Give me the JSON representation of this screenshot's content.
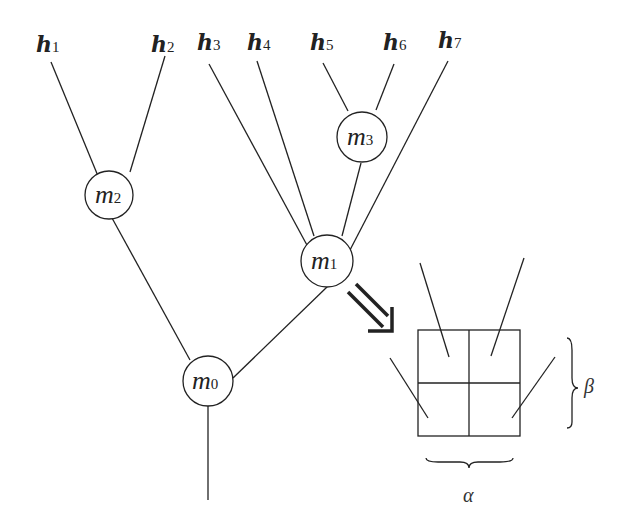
{
  "diagram": {
    "leaves": [
      {
        "base": "h",
        "sub": "1"
      },
      {
        "base": "h",
        "sub": "2"
      },
      {
        "base": "h",
        "sub": "3"
      },
      {
        "base": "h",
        "sub": "4"
      },
      {
        "base": "h",
        "sub": "5"
      },
      {
        "base": "h",
        "sub": "6"
      },
      {
        "base": "h",
        "sub": "7"
      }
    ],
    "nodes": [
      {
        "base": "m",
        "sub": "0"
      },
      {
        "base": "m",
        "sub": "1"
      },
      {
        "base": "m",
        "sub": "2"
      },
      {
        "base": "m",
        "sub": "3"
      }
    ],
    "inset": {
      "grid": "2x2",
      "alpha_label": "α",
      "beta_label": "β"
    },
    "arrow": "double-arrow-down-right"
  }
}
